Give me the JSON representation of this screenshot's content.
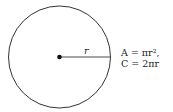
{
  "diagram": {
    "type": "circle-radius",
    "radius_label": "r",
    "formulas": {
      "area": "A = πr²,",
      "circumference": "C = 2πr"
    }
  }
}
